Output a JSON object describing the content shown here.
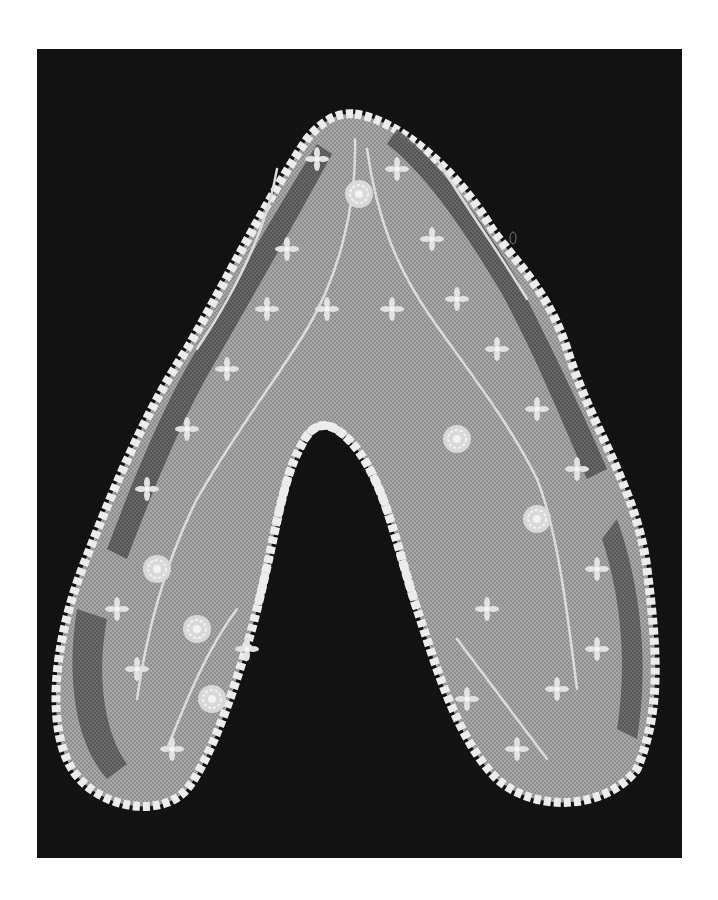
{
  "image": {
    "subject": "lace collar",
    "alt": "Black-and-white photograph of a white lace collar with floral sprig embroidery on net, laid flat in an inverted V shape against a dark background",
    "page_background": "#ffffff",
    "photo_background": "#111111",
    "net_color": "#9a9a9a",
    "net_dark_color": "#555555",
    "edge_color": "#ececec",
    "motif_color": "#e2e2e2"
  },
  "photo_frame": {
    "x": 37,
    "y": 49,
    "width": 645,
    "height": 809
  }
}
